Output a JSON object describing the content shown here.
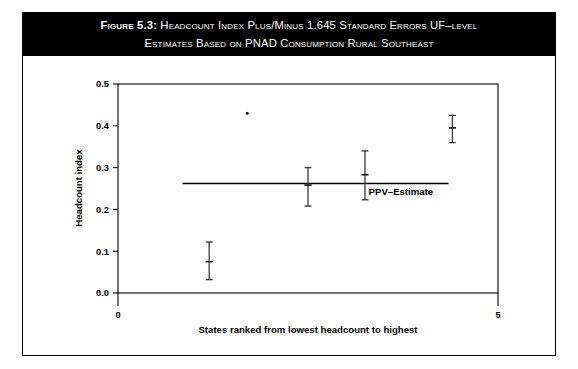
{
  "figure": {
    "label": "Figure 5.3:",
    "title_line_1": "Headcount Index Plus/Minus 1.645 Standard Errors UF–level",
    "title_line_2": "Estimates Based on PNAD Consumption Rural Southeast"
  },
  "chart_data": {
    "type": "scatter",
    "title": "Headcount Index Plus/Minus 1.645 Standard Errors UF–level Estimates Based on PNAD Consumption Rural Southeast",
    "xlabel": "States ranked from lowest headcount to highest",
    "ylabel": "Headcount index",
    "xlim": [
      0,
      5
    ],
    "ylim": [
      0.0,
      0.5
    ],
    "xticks": [
      "0",
      "5"
    ],
    "xtick_values": [
      0,
      5
    ],
    "yticks": [
      "0.0",
      "0.1",
      "0.2",
      "0.3",
      "0.4",
      "0.5"
    ],
    "ytick_values": [
      0.0,
      0.1,
      0.2,
      0.3,
      0.4,
      0.5
    ],
    "grid": false,
    "legend": "none",
    "x": [
      1.2,
      1.7,
      2.5,
      3.25,
      4.4
    ],
    "values": [
      0.075,
      0.43,
      0.258,
      0.283,
      0.395
    ],
    "ci_low": [
      0.032,
      null,
      0.208,
      0.223,
      0.36
    ],
    "ci_high": [
      0.122,
      null,
      0.3,
      0.34,
      0.425
    ],
    "points": [
      {
        "rank": 1,
        "x": 1.2,
        "estimate": 0.075,
        "lower": 0.032,
        "upper": 0.122,
        "has_error_bar": true
      },
      {
        "rank": 2,
        "x": 1.7,
        "estimate": 0.43,
        "lower": null,
        "upper": null,
        "has_error_bar": false
      },
      {
        "rank": 3,
        "x": 2.5,
        "estimate": 0.258,
        "lower": 0.208,
        "upper": 0.3,
        "has_error_bar": true
      },
      {
        "rank": 4,
        "x": 3.25,
        "estimate": 0.283,
        "lower": 0.223,
        "upper": 0.34,
        "has_error_bar": true
      },
      {
        "rank": 5,
        "x": 4.4,
        "estimate": 0.395,
        "lower": 0.36,
        "upper": 0.425,
        "has_error_bar": true
      }
    ],
    "reference_line": {
      "label": "PPV–Estimate",
      "value": 0.262,
      "x_start": 0.85,
      "x_end": 4.35
    }
  },
  "colors": {
    "title_background": "#000000",
    "title_text": "#ffffff",
    "axis": "#000000",
    "marker": "#111111",
    "error_bar": "#3a3a3a",
    "reference_line": "#000000",
    "page_background": "#ffffff"
  }
}
